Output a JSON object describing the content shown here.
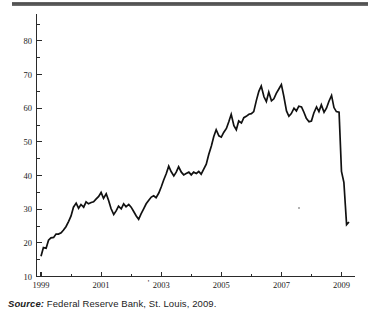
{
  "figure": {
    "top_rule_color": "#4a4a4a",
    "line_color": "#111111",
    "axis_color": "#2a2a2a",
    "background": "#ffffff"
  },
  "caption": {
    "source_label": "Source:",
    "source_text": "Federal Reserve Bank, St. Louis, 2009."
  },
  "chart_data": {
    "type": "line",
    "title": "",
    "subtitle": "",
    "xlabel": "",
    "ylabel": "",
    "xlim": [
      1998.85,
      2009.45
    ],
    "ylim": [
      10,
      88
    ],
    "grid": false,
    "legend": null,
    "x_tick_labels": [
      "1999",
      "2001",
      "2003",
      "2005",
      "2007",
      "2009"
    ],
    "x_tick_values": [
      1999,
      2001,
      2003,
      2005,
      2007,
      2009
    ],
    "x_minor_tick_values": [
      2000,
      2002,
      2004,
      2006,
      2008
    ],
    "y_tick_labels": [
      "10",
      "20",
      "30",
      "40",
      "50",
      "60",
      "70",
      "80"
    ],
    "y_tick_values": [
      10,
      20,
      30,
      40,
      50,
      60,
      70,
      80
    ],
    "y_minor_tick_values": [
      15,
      25,
      35,
      45,
      55,
      65,
      75,
      85
    ],
    "series": [
      {
        "name": "series-1",
        "color": "#111111",
        "x": [
          1999.0,
          1999.08,
          1999.17,
          1999.25,
          1999.33,
          1999.42,
          1999.5,
          1999.58,
          1999.67,
          1999.75,
          1999.83,
          1999.92,
          2000.0,
          2000.08,
          2000.17,
          2000.25,
          2000.33,
          2000.42,
          2000.5,
          2000.58,
          2000.67,
          2000.75,
          2000.83,
          2000.92,
          2001.0,
          2001.08,
          2001.17,
          2001.25,
          2001.33,
          2001.42,
          2001.5,
          2001.58,
          2001.67,
          2001.75,
          2001.83,
          2001.92,
          2002.0,
          2002.08,
          2002.17,
          2002.25,
          2002.33,
          2002.42,
          2002.5,
          2002.58,
          2002.67,
          2002.75,
          2002.83,
          2002.92,
          2003.0,
          2003.08,
          2003.17,
          2003.25,
          2003.33,
          2003.42,
          2003.5,
          2003.58,
          2003.67,
          2003.75,
          2003.83,
          2003.92,
          2004.0,
          2004.08,
          2004.17,
          2004.25,
          2004.33,
          2004.42,
          2004.5,
          2004.58,
          2004.67,
          2004.75,
          2004.83,
          2004.92,
          2005.0,
          2005.08,
          2005.17,
          2005.25,
          2005.33,
          2005.42,
          2005.5,
          2005.58,
          2005.67,
          2005.75,
          2005.83,
          2005.92,
          2006.0,
          2006.08,
          2006.17,
          2006.25,
          2006.33,
          2006.42,
          2006.5,
          2006.58,
          2006.67,
          2006.75,
          2006.83,
          2006.92,
          2007.0,
          2007.08,
          2007.17,
          2007.25,
          2007.33,
          2007.42,
          2007.5,
          2007.58,
          2007.67,
          2007.75,
          2007.83,
          2007.92,
          2008.0,
          2008.08,
          2008.17,
          2008.25,
          2008.33,
          2008.42,
          2008.5,
          2008.58,
          2008.67,
          2008.75,
          2008.83,
          2008.92,
          2009.0,
          2009.08,
          2009.17,
          2009.25
        ],
        "y": [
          16.0,
          18.6,
          18.4,
          20.8,
          21.5,
          21.6,
          22.6,
          22.6,
          23.0,
          23.8,
          24.8,
          26.4,
          28.0,
          30.6,
          31.8,
          30.3,
          31.4,
          30.6,
          32.2,
          31.6,
          32.0,
          32.2,
          33.0,
          33.8,
          35.0,
          33.2,
          34.6,
          32.6,
          30.2,
          28.4,
          29.5,
          30.9,
          30.1,
          31.6,
          30.7,
          31.4,
          30.6,
          29.4,
          28.0,
          27.0,
          28.6,
          30.2,
          31.6,
          32.6,
          33.6,
          34.0,
          33.4,
          34.8,
          36.6,
          38.6,
          40.6,
          42.8,
          41.2,
          39.9,
          41.0,
          42.6,
          41.0,
          40.2,
          40.6,
          41.0,
          40.2,
          41.0,
          40.6,
          41.2,
          40.4,
          42.0,
          43.4,
          46.2,
          48.8,
          51.6,
          53.6,
          51.8,
          51.4,
          52.8,
          54.0,
          56.0,
          58.2,
          54.8,
          53.6,
          56.2,
          55.6,
          57.2,
          57.6,
          58.2,
          58.4,
          59.0,
          62.4,
          65.0,
          66.6,
          63.4,
          62.0,
          64.8,
          62.2,
          62.8,
          64.4,
          65.8,
          67.0,
          63.6,
          59.2,
          57.6,
          58.4,
          60.0,
          59.2,
          60.6,
          60.4,
          58.8,
          57.0,
          56.0,
          56.2,
          58.6,
          60.4,
          59.0,
          61.0,
          58.8,
          60.0,
          62.0,
          63.8,
          60.2,
          59.0,
          58.8,
          41.2,
          38.0,
          25.4,
          26.2
        ]
      }
    ]
  }
}
